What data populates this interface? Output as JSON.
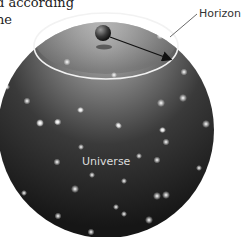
{
  "caption": {
    "line1": "d according",
    "line2": "ne"
  },
  "labels": {
    "horizon": "Horizon",
    "universe": "Universe"
  },
  "colors": {
    "sphere_dark": "#1e1e1e",
    "sphere_light": "#9a9a9a",
    "horizon_ring": "#f2f2f2",
    "arrow": "#111111",
    "star": "#ffffff"
  }
}
